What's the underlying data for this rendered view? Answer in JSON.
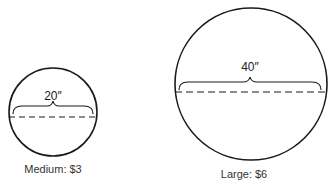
{
  "figure": {
    "pizzas": [
      {
        "name": "medium-pizza",
        "diameter_label": "20″",
        "caption": "Medium: $3",
        "diameter_in": 20,
        "price_usd": 3
      },
      {
        "name": "large-pizza",
        "diameter_label": "40″",
        "caption": "Large: $6",
        "diameter_in": 40,
        "price_usd": 6
      }
    ],
    "colors": {
      "stroke": "#1a1a1a",
      "text": "#333333",
      "background": "#ffffff"
    }
  }
}
